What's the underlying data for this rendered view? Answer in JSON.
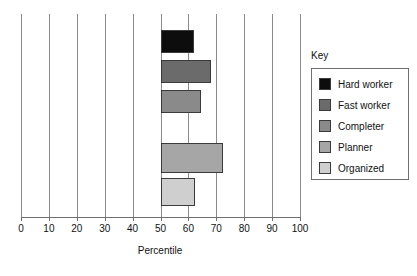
{
  "chart_data": {
    "type": "bar",
    "orientation": "horizontal",
    "title": "",
    "xlabel": "Percentile",
    "ylabel": "",
    "xlim": [
      0,
      100
    ],
    "xticks": [
      0,
      10,
      20,
      30,
      40,
      50,
      60,
      70,
      80,
      90,
      100
    ],
    "xtick_labels": [
      "0",
      "10",
      "20",
      "30",
      "40",
      "50",
      "60",
      "70",
      "80",
      "90",
      "100"
    ],
    "grid": true,
    "baseline": 50,
    "legend_position": "right",
    "legend_title": "Key",
    "categories": [
      "Hard worker",
      "Fast worker",
      "Completer",
      "Planner",
      "Organized"
    ],
    "values": [
      62,
      68,
      64.5,
      72.5,
      62.5
    ],
    "series": [
      {
        "name": "Hard worker",
        "value": 62,
        "color": "#0d0d0d"
      },
      {
        "name": "Fast worker",
        "value": 68,
        "color": "#6b6b6b"
      },
      {
        "name": "Completer",
        "value": 64.5,
        "color": "#8a8a8a"
      },
      {
        "name": "Planner",
        "value": 72.5,
        "color": "#a6a6a6"
      },
      {
        "name": "Organized",
        "value": 62.5,
        "color": "#cfcfcf"
      }
    ]
  },
  "legend": {
    "title": "Key",
    "items": [
      {
        "label": "Hard worker",
        "color": "#0d0d0d"
      },
      {
        "label": "Fast worker",
        "color": "#6b6b6b"
      },
      {
        "label": "Completer",
        "color": "#8a8a8a"
      },
      {
        "label": "Planner",
        "color": "#a6a6a6"
      },
      {
        "label": "Organized",
        "color": "#cfcfcf"
      }
    ]
  },
  "axis": {
    "title": "Percentile",
    "ticks": [
      "0",
      "10",
      "20",
      "30",
      "40",
      "50",
      "60",
      "70",
      "80",
      "90",
      "100"
    ]
  },
  "colors": {
    "gridline": "#8a8a8a",
    "axis": "#6f6f6f",
    "bar_border": "#3a3a3a",
    "text": "#111111",
    "background": "#ffffff"
  }
}
